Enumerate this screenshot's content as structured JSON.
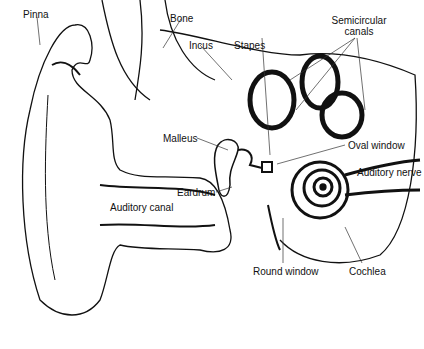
{
  "labels": {
    "pinna": "Pinna",
    "bone": "Bone",
    "incus": "Incus",
    "stapes": "Stapes",
    "semicircular_canals_line1": "Semicircular",
    "semicircular_canals_line2": "canals",
    "malleus": "Malleus",
    "oval_window": "Oval window",
    "auditory_nerve": "Auditory nerve",
    "eardrum": "Eardrum",
    "auditory_canal": "Auditory canal",
    "round_window": "Round window",
    "cochlea": "Cochlea"
  },
  "colors": {
    "ink": "#111111",
    "background": "#ffffff"
  }
}
